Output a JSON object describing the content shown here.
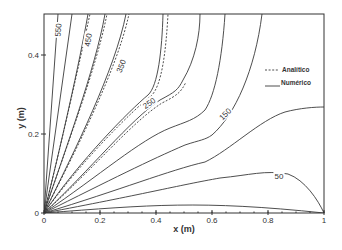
{
  "chart_data": {
    "type": "contour",
    "title": "",
    "xlabel": "x (m)",
    "ylabel": "y (m)",
    "xlim": [
      0,
      1
    ],
    "ylim": [
      0,
      0.5
    ],
    "grid": false,
    "x_ticks": [
      "0",
      "0.2",
      "0.4",
      "0.6",
      "0.8",
      "1"
    ],
    "y_ticks": [
      "0",
      "0.2",
      "0.4"
    ],
    "legend": {
      "position": "upper right (inside)",
      "entries": [
        {
          "label": "Analítico",
          "style": "dashed"
        },
        {
          "label": "Numérico",
          "style": "solid"
        }
      ]
    },
    "contour_labels": [
      "550",
      "450",
      "350",
      "250",
      "150",
      "50"
    ],
    "contour_levels": [
      600,
      550,
      500,
      450,
      400,
      350,
      300,
      250,
      200,
      150,
      100,
      50
    ],
    "series": [
      {
        "name": "Numérico",
        "style": "solid"
      },
      {
        "name": "Analítico",
        "style": "dashed"
      }
    ]
  },
  "plot": {
    "frame": {
      "left": 44,
      "top": 14,
      "right": 324,
      "bottom": 213
    },
    "x_ticks": [
      {
        "label": "0",
        "px": 44
      },
      {
        "label": "0.2",
        "px": 100
      },
      {
        "label": "0.4",
        "px": 156
      },
      {
        "label": "0.6",
        "px": 212
      },
      {
        "label": "0.8",
        "px": 268
      },
      {
        "label": "1",
        "px": 324
      }
    ],
    "y_ticks": [
      {
        "label": "0",
        "py": 213
      },
      {
        "label": "0.2",
        "py": 134
      },
      {
        "label": "0.4",
        "py": 55
      }
    ],
    "xlabel": "x (m)",
    "ylabel": "y (m)",
    "numeric_paths": [
      "M44,213 L58,14",
      "M44,213 L72,14",
      "M44,213 C60,150 80,60 88,14",
      "M44,213 C65,150 95,70 105,14",
      "M44,213 C75,150 115,70 126,14",
      "M44,213 C80,160 130,110 148,95 C158,86 162,50 163,14",
      "M44,213 C90,170 130,120 160,100 C175,92 178,90 183,80 C195,60 200,35 200,14",
      "M44,213 C100,175 140,140 170,128 C185,122 195,120 205,110 C215,95 222,60 225,14",
      "M44,213 C110,180 150,160 185,145 C200,140 205,140 212,135 C235,115 255,70 262,14",
      "M44,213 C120,190 170,170 205,162 C230,150 260,120 285,112 C300,108 315,107 324,107",
      "M44,213 C140,195 180,185 220,178 C250,175 265,170 288,174 C305,180 318,200 324,213",
      "M44,213 C150,205 200,200 324,213"
    ],
    "analytic_paths": [
      "M44,213 C60,150 80,60 90,14",
      "M44,213 C65,150 96,70 107,14",
      "M44,213 C76,150 117,70 129,14",
      "M44,213 C82,160 133,110 151,96 C162,86 166,50 168,14",
      "M44,213 C92,170 132,122 162,103 C178,95 181,92 186,82"
    ],
    "labels": [
      {
        "text": "550",
        "x": 58,
        "y": 30,
        "rotate": -86
      },
      {
        "text": "450",
        "x": 88,
        "y": 40,
        "rotate": -80
      },
      {
        "text": "350",
        "x": 121,
        "y": 66,
        "rotate": -68
      },
      {
        "text": "250",
        "x": 149,
        "y": 103,
        "rotate": -35
      },
      {
        "text": "150",
        "x": 225,
        "y": 114,
        "rotate": -45
      },
      {
        "text": "50",
        "x": 279,
        "y": 176,
        "rotate": 0
      }
    ],
    "legend": {
      "analytic_label": "Analítico",
      "numeric_label": "Numérico"
    }
  }
}
